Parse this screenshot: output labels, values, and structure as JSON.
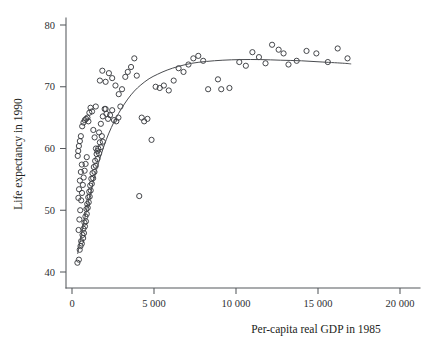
{
  "chart_data": {
    "type": "scatter",
    "title": "",
    "xlabel": "Per-capita real GDP in 1985",
    "ylabel": "Life expectancy in 1990",
    "xlim": [
      -700,
      21500
    ],
    "ylim": [
      38.2,
      81.5
    ],
    "grid": false,
    "legend": null,
    "xticks": [
      0,
      5000,
      10000,
      15000,
      20000
    ],
    "xtick_labels": [
      "0",
      "5 000",
      "10 000",
      "15 000",
      "20 000"
    ],
    "yticks": [
      40,
      50,
      60,
      70,
      80
    ],
    "ytick_labels": [
      "40",
      "50",
      "60",
      "70",
      "80"
    ],
    "marker_style": "open-circle",
    "marker_radius_px": 2.6,
    "series": [
      {
        "name": "countries",
        "points": [
          [
            330,
            41.5
          ],
          [
            420,
            42.0
          ],
          [
            470,
            43.6
          ],
          [
            520,
            44.2
          ],
          [
            560,
            45.0
          ],
          [
            600,
            44.6
          ],
          [
            640,
            46.0
          ],
          [
            680,
            45.5
          ],
          [
            700,
            47.0
          ],
          [
            730,
            46.3
          ],
          [
            760,
            48.0
          ],
          [
            790,
            47.4
          ],
          [
            820,
            49.0
          ],
          [
            850,
            48.2
          ],
          [
            880,
            50.2
          ],
          [
            900,
            49.4
          ],
          [
            930,
            51.0
          ],
          [
            960,
            50.4
          ],
          [
            990,
            52.1
          ],
          [
            1020,
            51.3
          ],
          [
            1050,
            53.0
          ],
          [
            1080,
            52.2
          ],
          [
            1110,
            54.0
          ],
          [
            1140,
            53.2
          ],
          [
            1180,
            55.1
          ],
          [
            1210,
            54.3
          ],
          [
            1250,
            56.0
          ],
          [
            1290,
            55.2
          ],
          [
            1330,
            57.0
          ],
          [
            1370,
            56.2
          ],
          [
            1410,
            58.0
          ],
          [
            1450,
            57.2
          ],
          [
            1500,
            59.1
          ],
          [
            1550,
            58.3
          ],
          [
            1600,
            60.0
          ],
          [
            1650,
            59.2
          ],
          [
            1700,
            61.0
          ],
          [
            1760,
            60.2
          ],
          [
            1820,
            62.0
          ],
          [
            1880,
            61.1
          ],
          [
            400,
            46.8
          ],
          [
            450,
            48.5
          ],
          [
            500,
            50.0
          ],
          [
            560,
            51.6
          ],
          [
            610,
            52.8
          ],
          [
            660,
            54.1
          ],
          [
            710,
            55.3
          ],
          [
            770,
            56.4
          ],
          [
            830,
            57.5
          ],
          [
            900,
            58.6
          ],
          [
            390,
            52.0
          ],
          [
            430,
            53.4
          ],
          [
            480,
            54.8
          ],
          [
            540,
            56.2
          ],
          [
            600,
            57.4
          ],
          [
            350,
            58.8
          ],
          [
            380,
            59.6
          ],
          [
            420,
            60.4
          ],
          [
            480,
            61.2
          ],
          [
            540,
            62.0
          ],
          [
            620,
            63.6
          ],
          [
            700,
            64.2
          ],
          [
            780,
            64.6
          ],
          [
            860,
            64.8
          ],
          [
            940,
            65.0
          ],
          [
            1000,
            64.4
          ],
          [
            1060,
            65.8
          ],
          [
            1130,
            66.6
          ],
          [
            1220,
            66.0
          ],
          [
            1300,
            63.0
          ],
          [
            1380,
            61.8
          ],
          [
            1460,
            60.0
          ],
          [
            1550,
            59.6
          ],
          [
            1650,
            62.6
          ],
          [
            1760,
            64.0
          ],
          [
            1880,
            65.2
          ],
          [
            1990,
            66.4
          ],
          [
            2100,
            65.6
          ],
          [
            2200,
            64.8
          ],
          [
            2320,
            65.4
          ],
          [
            2450,
            66.2
          ],
          [
            2560,
            64.6
          ],
          [
            2700,
            64.4
          ],
          [
            2830,
            65.0
          ],
          [
            2950,
            66.8
          ],
          [
            1700,
            71.0
          ],
          [
            1850,
            72.6
          ],
          [
            2050,
            70.8
          ],
          [
            2250,
            72.2
          ],
          [
            2450,
            71.4
          ],
          [
            2650,
            70.2
          ],
          [
            2850,
            68.8
          ],
          [
            3050,
            69.6
          ],
          [
            3250,
            71.6
          ],
          [
            3400,
            72.4
          ],
          [
            3600,
            73.2
          ],
          [
            3800,
            74.6
          ],
          [
            3950,
            71.8
          ],
          [
            4100,
            52.3
          ],
          [
            4250,
            65.0
          ],
          [
            4400,
            64.4
          ],
          [
            4600,
            64.8
          ],
          [
            4850,
            61.4
          ],
          [
            5100,
            70.0
          ],
          [
            5350,
            69.8
          ],
          [
            5600,
            70.2
          ],
          [
            5900,
            69.4
          ],
          [
            6200,
            71.0
          ],
          [
            6500,
            73.0
          ],
          [
            6800,
            72.4
          ],
          [
            7100,
            73.6
          ],
          [
            7400,
            74.6
          ],
          [
            7700,
            75.0
          ],
          [
            8000,
            74.2
          ],
          [
            8300,
            69.6
          ],
          [
            8900,
            71.2
          ],
          [
            9600,
            69.8
          ],
          [
            10200,
            74.0
          ],
          [
            10600,
            73.4
          ],
          [
            11000,
            75.6
          ],
          [
            11400,
            74.8
          ],
          [
            11800,
            73.8
          ],
          [
            12200,
            76.8
          ],
          [
            12600,
            76.0
          ],
          [
            12900,
            75.4
          ],
          [
            13200,
            73.6
          ],
          [
            13700,
            74.2
          ],
          [
            14300,
            75.8
          ],
          [
            14900,
            75.4
          ],
          [
            15600,
            74.0
          ],
          [
            16200,
            76.2
          ],
          [
            16800,
            74.6
          ],
          [
            9100,
            69.6
          ],
          [
            2050,
            66.4
          ],
          [
            1450,
            66.8
          ]
        ]
      }
    ],
    "fit_curve": {
      "name": "smoothed fit",
      "points": [
        [
          350,
          43.0
        ],
        [
          600,
          46.4
        ],
        [
          900,
          50.2
        ],
        [
          1200,
          53.6
        ],
        [
          1500,
          56.6
        ],
        [
          1800,
          59.2
        ],
        [
          2100,
          61.5
        ],
        [
          2400,
          63.4
        ],
        [
          2700,
          65.0
        ],
        [
          3000,
          66.4
        ],
        [
          3400,
          68.0
        ],
        [
          3800,
          69.3
        ],
        [
          4200,
          70.3
        ],
        [
          4700,
          71.3
        ],
        [
          5200,
          72.0
        ],
        [
          5800,
          72.7
        ],
        [
          6500,
          73.3
        ],
        [
          7300,
          73.8
        ],
        [
          8200,
          74.1
        ],
        [
          9200,
          74.3
        ],
        [
          10300,
          74.4
        ],
        [
          11500,
          74.4
        ],
        [
          12700,
          74.3
        ],
        [
          14000,
          74.2
        ],
        [
          15300,
          74.0
        ],
        [
          16600,
          73.8
        ],
        [
          17000,
          73.7
        ]
      ]
    }
  }
}
